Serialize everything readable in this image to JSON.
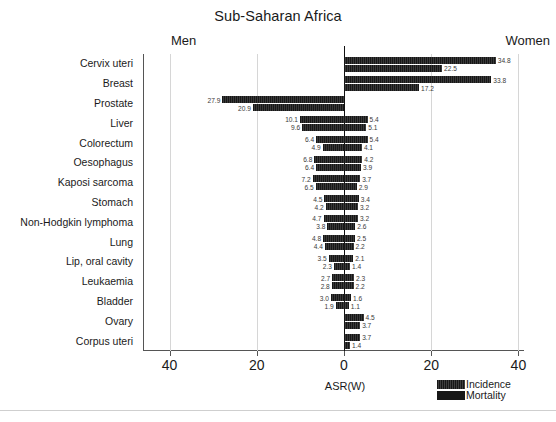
{
  "chart_data": {
    "type": "bar",
    "title": "Sub-Saharan Africa",
    "subtitle": "",
    "xlabel": "ASR(W)",
    "ylabel": "",
    "orientation": "horizontal",
    "style": "population-pyramid",
    "panel_labels": {
      "left": "Men",
      "right": "Women"
    },
    "xlim": [
      -40,
      40
    ],
    "xticks": [
      -40,
      -20,
      0,
      20,
      40
    ],
    "xtick_labels": [
      "40",
      "20",
      "0",
      "20",
      "40"
    ],
    "grid": true,
    "gridlines_at": [
      -40,
      -20,
      20,
      40
    ],
    "legend": {
      "position": "bottom-right",
      "entries": [
        {
          "label": "Incidence",
          "color": "#171717"
        },
        {
          "label": "Mortality",
          "color": "#171717"
        }
      ]
    },
    "series": [
      {
        "name": "Incidence",
        "color": "#171717"
      },
      {
        "name": "Mortality",
        "color": "#171717"
      }
    ],
    "categories": [
      "Cervix uteri",
      "Breast",
      "Prostate",
      "Liver",
      "Colorectum",
      "Oesophagus",
      "Kaposi sarcoma",
      "Stomach",
      "Non-Hodgkin lymphoma",
      "Lung",
      "Lip, oral cavity",
      "Leukaemia",
      "Bladder",
      "Ovary",
      "Corpus uteri"
    ],
    "rows": [
      {
        "category": "Cervix uteri",
        "men": {
          "incidence": null,
          "mortality": null
        },
        "women": {
          "incidence": 34.8,
          "mortality": 22.5
        }
      },
      {
        "category": "Breast",
        "men": {
          "incidence": null,
          "mortality": null
        },
        "women": {
          "incidence": 33.8,
          "mortality": 17.2
        }
      },
      {
        "category": "Prostate",
        "men": {
          "incidence": 27.9,
          "mortality": 20.9
        },
        "women": {
          "incidence": null,
          "mortality": null
        }
      },
      {
        "category": "Liver",
        "men": {
          "incidence": 10.1,
          "mortality": 9.6
        },
        "women": {
          "incidence": 5.4,
          "mortality": 5.1
        }
      },
      {
        "category": "Colorectum",
        "men": {
          "incidence": 6.4,
          "mortality": 4.9
        },
        "women": {
          "incidence": 5.4,
          "mortality": 4.1
        }
      },
      {
        "category": "Oesophagus",
        "men": {
          "incidence": 6.8,
          "mortality": 6.4
        },
        "women": {
          "incidence": 4.2,
          "mortality": 3.9
        }
      },
      {
        "category": "Kaposi sarcoma",
        "men": {
          "incidence": 7.2,
          "mortality": 6.5
        },
        "women": {
          "incidence": 3.7,
          "mortality": 2.9
        }
      },
      {
        "category": "Stomach",
        "men": {
          "incidence": 4.5,
          "mortality": 4.2
        },
        "women": {
          "incidence": 3.4,
          "mortality": 3.2
        }
      },
      {
        "category": "Non-Hodgkin lymphoma",
        "men": {
          "incidence": 4.7,
          "mortality": 3.8
        },
        "women": {
          "incidence": 3.2,
          "mortality": 2.6
        }
      },
      {
        "category": "Lung",
        "men": {
          "incidence": 4.8,
          "mortality": 4.4
        },
        "women": {
          "incidence": 2.5,
          "mortality": 2.2
        }
      },
      {
        "category": "Lip, oral cavity",
        "men": {
          "incidence": 3.5,
          "mortality": 2.3
        },
        "women": {
          "incidence": 2.1,
          "mortality": 1.4
        }
      },
      {
        "category": "Leukaemia",
        "men": {
          "incidence": 2.7,
          "mortality": 2.8
        },
        "women": {
          "incidence": 2.3,
          "mortality": 2.2
        }
      },
      {
        "category": "Bladder",
        "men": {
          "incidence": 3.0,
          "mortality": 1.9
        },
        "women": {
          "incidence": 1.6,
          "mortality": 1.1
        }
      },
      {
        "category": "Ovary",
        "men": {
          "incidence": null,
          "mortality": null
        },
        "women": {
          "incidence": 4.5,
          "mortality": 3.7
        }
      },
      {
        "category": "Corpus uteri",
        "men": {
          "incidence": null,
          "mortality": null
        },
        "women": {
          "incidence": 3.7,
          "mortality": 1.4
        }
      }
    ]
  }
}
